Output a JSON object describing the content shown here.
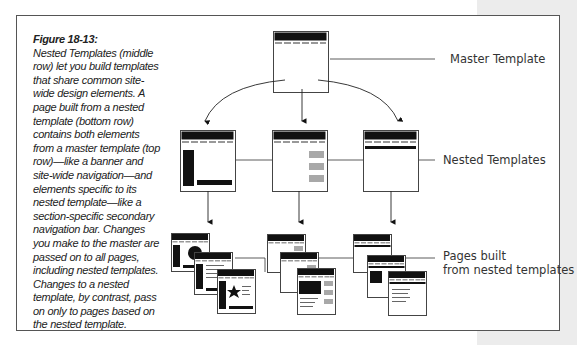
{
  "figure": {
    "number": "Figure 18-13:",
    "caption": "Nested Templates (middle row) let you build templates that share common site-wide design elements. A page built from a nested template (bottom row) contains both elements from a master template (top row)—like a banner and site-wide navigation—and elements specific to its nested template—like a section-specific secondary navigation bar. Changes you make to the master are passed on to all pages, including nested templates. Changes to a nested template, by contrast, pass on only to pages based on the nested template."
  },
  "labels": {
    "master": "Master Template",
    "nested": "Nested Templates",
    "pages_line1": "Pages built",
    "pages_line2": "from nested templates"
  },
  "diagram": {
    "rows": [
      {
        "name": "master",
        "count": 1
      },
      {
        "name": "nested-templates",
        "count": 3,
        "variants": [
          "left-sidebar-and-footer-bar",
          "right-gray-boxes",
          "secondary-nav-bar"
        ]
      },
      {
        "name": "pages",
        "groups": 3,
        "pages_per_group": 3
      }
    ],
    "colors": {
      "ink": "#111111",
      "gray_box": "#a8a8a8",
      "frame": "#555555",
      "margin": "#ececec"
    }
  }
}
